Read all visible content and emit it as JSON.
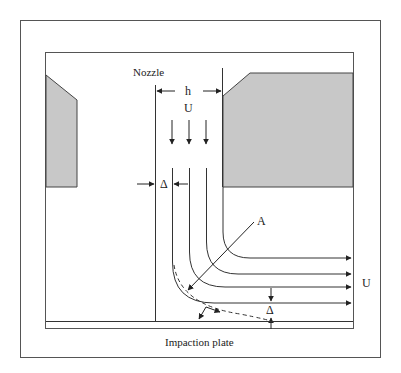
{
  "diagram": {
    "title": "",
    "labels": {
      "nozzle": "Nozzle",
      "width": "h",
      "velocity_in": "U",
      "velocity_out": "U",
      "delta_nozzle": "Δ",
      "delta_plate": "Δ",
      "section": "A",
      "plate": "Impaction plate"
    },
    "colors": {
      "line": "#333333",
      "frame": "#555555",
      "block_fill": "#c8c8c8"
    }
  }
}
